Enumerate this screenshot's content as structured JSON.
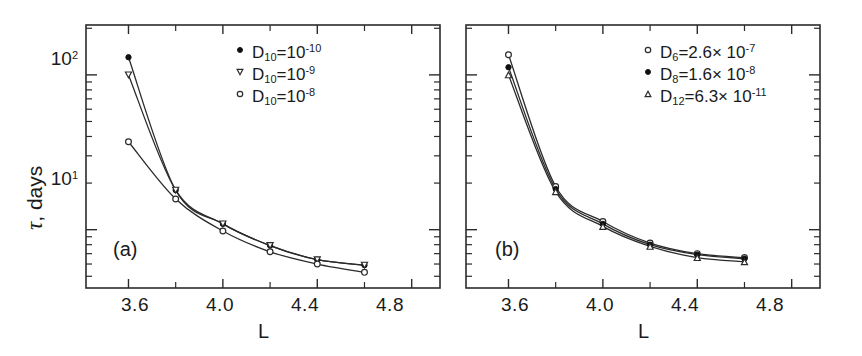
{
  "figure": {
    "background": "#ffffff",
    "ink": "#2b2b2b",
    "axis_label_x": "L",
    "axis_label_y_symbol": "τ",
    "axis_label_y_rest": ", days",
    "y_tick_labels": [
      "10",
      "10"
    ],
    "y_tick_exponents": [
      "1",
      "2"
    ],
    "x_tick_labels": [
      "3.6",
      "4.0",
      "4.4",
      "4.8"
    ]
  },
  "panels": [
    {
      "tag": "(a)",
      "legend": [
        {
          "marker": "filled-circle",
          "symbol": "D",
          "sub": "10",
          "eq": "=10",
          "sup": "-10"
        },
        {
          "marker": "open-triangle-down",
          "symbol": "D",
          "sub": "10",
          "eq": "=10",
          "sup": "-9"
        },
        {
          "marker": "open-circle",
          "symbol": "D",
          "sub": "10",
          "eq": "=10",
          "sup": "-8"
        }
      ]
    },
    {
      "tag": "(b)",
      "legend": [
        {
          "marker": "open-circle",
          "symbol": "D",
          "sub": "6",
          "eq": "=2.6× 10",
          "sup": "-7"
        },
        {
          "marker": "filled-circle",
          "symbol": "D",
          "sub": "8",
          "eq": "=1.6× 10",
          "sup": "-8"
        },
        {
          "marker": "open-triangle-up",
          "symbol": "D",
          "sub": "12",
          "eq": "=6.3× 10",
          "sup": "-11"
        }
      ]
    }
  ],
  "chart_data": [
    {
      "type": "line",
      "panel": "(a)",
      "title": "",
      "xlabel": "L",
      "ylabel": "τ, days",
      "xlim": [
        3.42,
        4.92
      ],
      "ylim": [
        4.2,
        210
      ],
      "yscale": "log",
      "xscale": "linear",
      "grid": false,
      "legend_position": "upper-right",
      "x": [
        3.6,
        3.8,
        4.0,
        4.2,
        4.4,
        4.6
      ],
      "series": [
        {
          "name": "D_10 = 10^-10",
          "marker": "filled-circle",
          "values": [
            130,
            18.0,
            10.9,
            7.9,
            6.4,
            5.9
          ]
        },
        {
          "name": "D_10 = 10^-9",
          "marker": "open-triangle-down",
          "values": [
            100,
            18.0,
            10.9,
            7.9,
            6.4,
            5.9
          ]
        },
        {
          "name": "D_10 = 10^-8",
          "marker": "open-circle",
          "values": [
            37,
            15.8,
            9.8,
            7.2,
            6.0,
            5.3
          ]
        }
      ]
    },
    {
      "type": "line",
      "panel": "(b)",
      "title": "",
      "xlabel": "L",
      "ylabel": "τ, days",
      "xlim": [
        3.42,
        4.92
      ],
      "ylim": [
        4.2,
        210
      ],
      "yscale": "log",
      "xscale": "linear",
      "grid": false,
      "legend_position": "upper-right",
      "x": [
        3.6,
        3.8,
        4.0,
        4.2,
        4.4,
        4.6
      ],
      "series": [
        {
          "name": "D_6 = 2.6e-7",
          "marker": "open-circle",
          "values": [
            135,
            19.0,
            11.3,
            8.2,
            7.0,
            6.6
          ]
        },
        {
          "name": "D_8 = 1.6e-8",
          "marker": "filled-circle",
          "values": [
            112,
            18.3,
            10.9,
            8.0,
            6.9,
            6.5
          ]
        },
        {
          "name": "D_12 = 6.3e-11",
          "marker": "open-triangle-up",
          "values": [
            100,
            17.6,
            10.5,
            7.8,
            6.6,
            6.2
          ]
        }
      ]
    }
  ]
}
